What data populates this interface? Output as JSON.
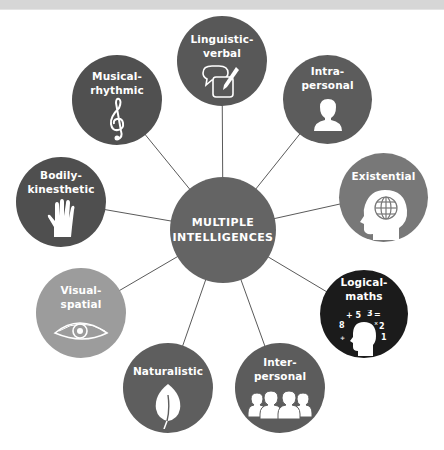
{
  "diagram": {
    "title": "MULTIPLE INTELLIGENCES",
    "center": {
      "label": "MULTIPLE\nINTELLIGENCES",
      "color": "#646464"
    },
    "nodes": [
      {
        "id": "linguistic",
        "label": "Linguistic-\nverbal",
        "icon": "speech-and-pen-icon",
        "color": "#585858"
      },
      {
        "id": "intrapersonal",
        "label": "Intra-\npersonal",
        "icon": "person-bust-icon",
        "color": "#5c5c5c"
      },
      {
        "id": "existential",
        "label": "Existential",
        "icon": "head-with-globe-icon",
        "color": "#787878"
      },
      {
        "id": "logical",
        "label": "Logical-\nmaths",
        "icon": "head-with-numbers-icon",
        "color": "#1b1b1b"
      },
      {
        "id": "interpersonal",
        "label": "Inter-\npersonal",
        "icon": "group-of-people-icon",
        "color": "#5c5c5c"
      },
      {
        "id": "naturalistic",
        "label": "Naturalistic",
        "icon": "leaf-icon",
        "color": "#5e5e5e"
      },
      {
        "id": "visual",
        "label": "Visual-\nspatial",
        "icon": "eye-icon",
        "color": "#9c9c9c"
      },
      {
        "id": "bodily",
        "label": "Bodily-\nkinesthetic",
        "icon": "hand-icon",
        "color": "#4f4f4f"
      },
      {
        "id": "musical",
        "label": "Musical-\nrhythmic",
        "icon": "treble-clef-icon",
        "color": "#505050"
      }
    ],
    "math_symbols": [
      "+ 5",
      "3",
      "=",
      "8",
      "×",
      "2",
      "÷",
      "1"
    ],
    "line_color": "#5a5a5a",
    "top_band_color": "#d6d6d6"
  }
}
